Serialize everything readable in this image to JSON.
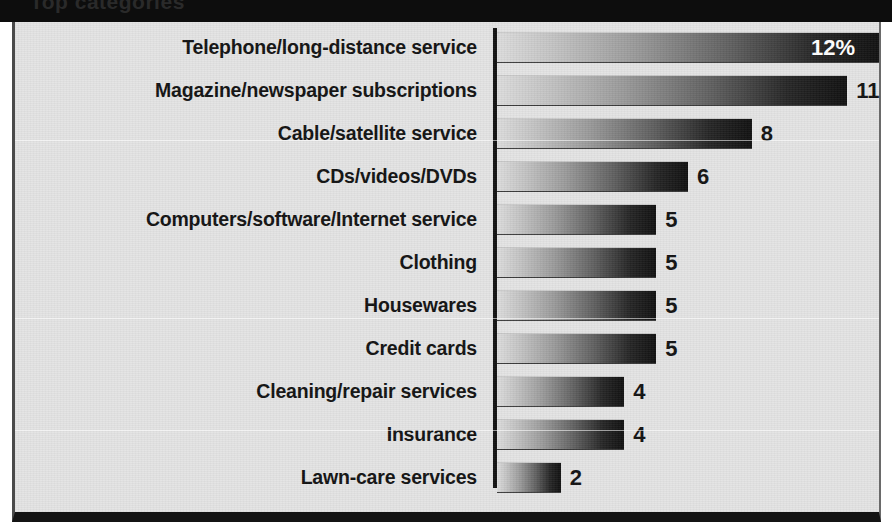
{
  "banner": {
    "text": "Top categories"
  },
  "chart_data": {
    "type": "bar",
    "orientation": "horizontal",
    "title": "",
    "xlabel": "",
    "ylabel": "",
    "xlim": [
      0,
      12
    ],
    "grid": false,
    "legend": null,
    "value_unit": "%",
    "categories": [
      "Telephone/long-distance service",
      "Magazine/newspaper subscriptions",
      "Cable/satellite service",
      "CDs/videos/DVDs",
      "Computers/software/Internet service",
      "Clothing",
      "Housewares",
      "Credit cards",
      "Cleaning/repair services",
      "Insurance",
      "Lawn-care services"
    ],
    "values": [
      12,
      11,
      8,
      6,
      5,
      5,
      5,
      5,
      4,
      4,
      2
    ],
    "value_labels": [
      "12%",
      "11",
      "8",
      "6",
      "5",
      "5",
      "5",
      "5",
      "4",
      "4",
      "2"
    ],
    "label_inside": [
      true,
      false,
      false,
      false,
      false,
      false,
      false,
      false,
      false,
      false,
      false
    ],
    "colors": {
      "bar_gradient_start": "#dcdcdc",
      "bar_gradient_end": "#101010",
      "plate_background": "#e3e3e3",
      "axis": "#111111",
      "banner": "#0d0d0d",
      "label_text": "#111111",
      "inside_label_text": "#ffffff"
    }
  }
}
